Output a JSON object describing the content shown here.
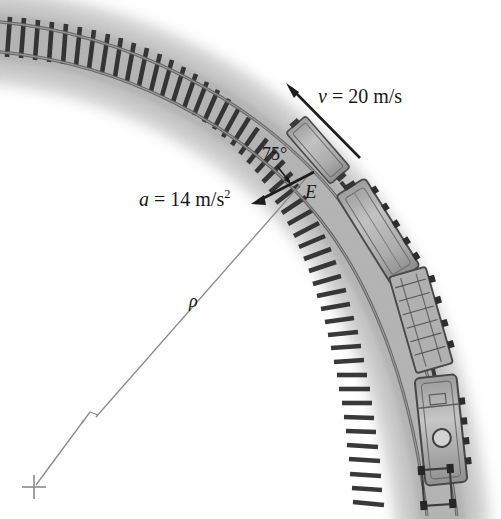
{
  "figure": {
    "background_color": "#ffffff",
    "ink_color": "#18181a",
    "ballast_color": "#c9c9c9",
    "rail_color": "#6f6f6f",
    "tie_color": "#2e2e2e",
    "car_body_color": "#b4b4b4",
    "car_outline_color": "#555555",
    "radius_line_color": "#8a8a8a"
  },
  "labels": {
    "velocity": {
      "symbol": "v",
      "equals": " = ",
      "value": "20",
      "unit": "m/s",
      "full": "v = 20 m/s"
    },
    "acceleration": {
      "symbol": "a",
      "equals": " = ",
      "value": "14",
      "unit": "m/s",
      "unit_exponent": "2",
      "full": "a = 14 m/s2"
    },
    "angle": {
      "value": "75",
      "degree_sign": "°",
      "full": "75°"
    },
    "point": {
      "name": "E"
    },
    "radius": {
      "symbol": "ρ"
    }
  },
  "geometry": {
    "point_e": {
      "x": 315,
      "y": 168
    },
    "velocity_arrow": {
      "from_x": 358,
      "from_y": 156,
      "to_x": 287,
      "to_y": 84
    },
    "acceleration_arrow": {
      "from_x": 313,
      "from_y": 172,
      "to_x": 252,
      "to_y": 203
    },
    "radius_line": {
      "from_x": 313,
      "from_y": 170,
      "to_x": 34,
      "to_y": 487
    },
    "center_of_curvature_marker": {
      "x": 34,
      "y": 487,
      "type": "cross"
    },
    "radius_break_marker": {
      "x": 90,
      "y": 416,
      "type": "break-tick"
    },
    "angle_leader": {
      "from_x": 278,
      "from_y": 167,
      "to_x": 289,
      "to_y": 180
    }
  }
}
